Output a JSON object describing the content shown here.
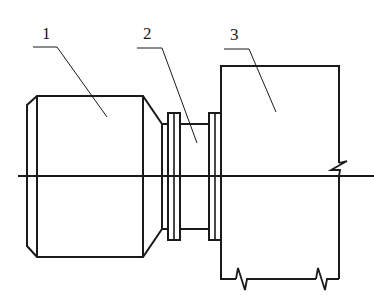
{
  "diagram": {
    "type": "mechanical-assembly-drawing",
    "stroke_color": "#1a1a1a",
    "background": "#ffffff",
    "labels": [
      {
        "id": "1",
        "text": "1",
        "x": 42,
        "y": 27
      },
      {
        "id": "2",
        "text": "2",
        "x": 144,
        "y": 27
      },
      {
        "id": "3",
        "text": "3",
        "x": 231,
        "y": 28
      }
    ],
    "parts": [
      {
        "id": "1",
        "description": "cylindrical body with chamfered ends"
      },
      {
        "id": "2",
        "description": "coupling with two flanges"
      },
      {
        "id": "3",
        "description": "housing / block with break lines"
      }
    ],
    "centerline": {
      "y": 176,
      "x1": 18,
      "x2": 374
    }
  }
}
